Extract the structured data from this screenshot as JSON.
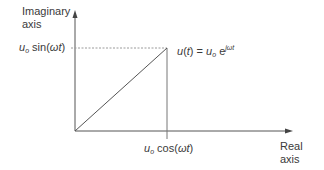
{
  "diagram": {
    "type": "phasor-diagram",
    "y_axis": {
      "label_line1": "Imaginary",
      "label_line2": "axis"
    },
    "x_axis": {
      "label_line1": "Real",
      "label_line2": "axis"
    },
    "y_projection": {
      "symbol": "u",
      "subscript": "o",
      "func": "sin(",
      "arg_omega": "ω",
      "arg_t": "t",
      "close": ")"
    },
    "x_projection": {
      "symbol": "u",
      "subscript": "o",
      "func": "cos(",
      "arg_omega": "ω",
      "arg_t": "t",
      "close": ")"
    },
    "phasor": {
      "lhs_symbol": "u",
      "lhs_open": "(",
      "lhs_t": "t",
      "lhs_close": ")",
      "equals": " = ",
      "rhs_symbol": "u",
      "rhs_subscript": "o",
      "exp_base": " e",
      "exponent": "jωt"
    },
    "colors": {
      "line": "#555555",
      "dashed": "#9a9a9a",
      "text": "#3a3a3a"
    }
  }
}
